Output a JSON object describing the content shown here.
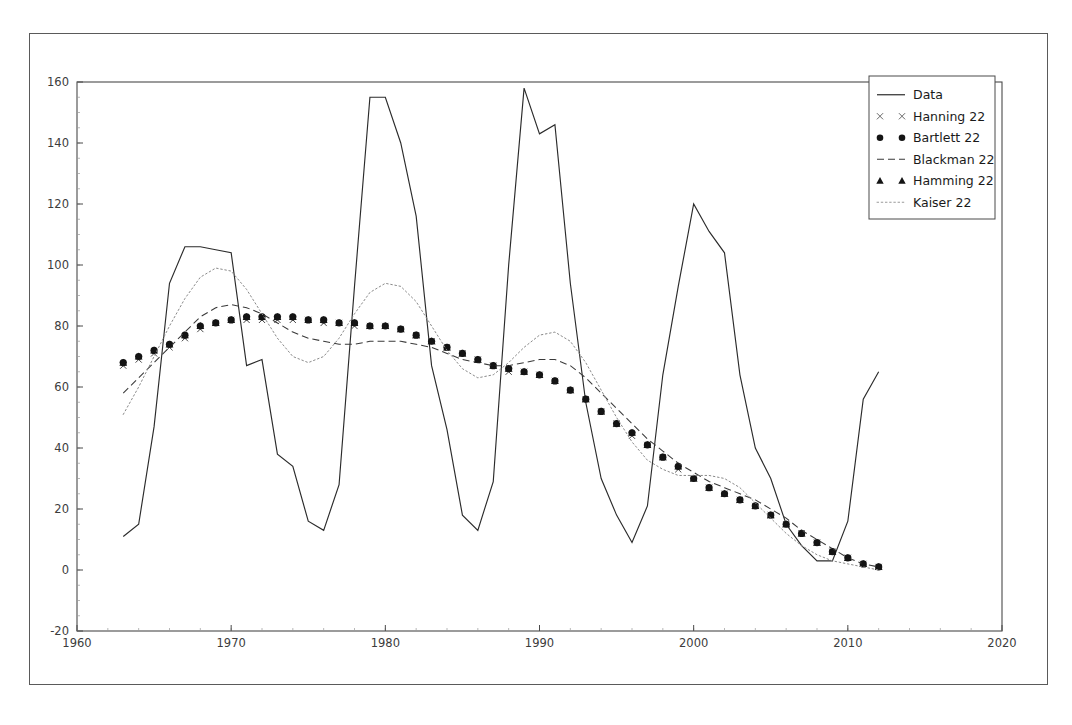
{
  "page": {
    "scan_header": "",
    "background_color": "#ffffff",
    "frame_color": "#5a5a5a"
  },
  "chart_data": {
    "type": "line",
    "title": "",
    "subtitle": "",
    "xlabel": "",
    "ylabel": "",
    "xlim": [
      1960,
      2020
    ],
    "ylim": [
      -20,
      160
    ],
    "xticks": [
      1960,
      1970,
      1980,
      1990,
      2000,
      2010,
      2020
    ],
    "xtick_labels": [
      "1960",
      "1970",
      "1980",
      "1990",
      "2000",
      "2010",
      "2020"
    ],
    "yticks": [
      -20,
      0,
      20,
      40,
      60,
      80,
      100,
      120,
      140,
      160
    ],
    "ytick_labels": [
      "-20",
      "0",
      "20",
      "40",
      "60",
      "80",
      "100",
      "120",
      "140",
      "160"
    ],
    "grid": false,
    "legend_position": "upper right",
    "legend_entries": [
      {
        "label": "Data",
        "style": "solid-line",
        "color": "#222222"
      },
      {
        "label": "Hanning 22",
        "style": "x-marker",
        "color": "#555555"
      },
      {
        "label": "Bartlett 22",
        "style": "circle-marker",
        "color": "#111111"
      },
      {
        "label": "Blackman 22",
        "style": "dashed-line",
        "color": "#333333"
      },
      {
        "label": "Hamming 22",
        "style": "triangle-marker",
        "color": "#111111"
      },
      {
        "label": "Kaiser 22",
        "style": "dotted-line",
        "color": "#777777"
      }
    ],
    "x": [
      1963,
      1964,
      1965,
      1966,
      1967,
      1968,
      1969,
      1970,
      1971,
      1972,
      1973,
      1974,
      1975,
      1976,
      1977,
      1978,
      1979,
      1980,
      1981,
      1982,
      1983,
      1984,
      1985,
      1986,
      1987,
      1988,
      1989,
      1990,
      1991,
      1992,
      1993,
      1994,
      1995,
      1996,
      1997,
      1998,
      1999,
      2000,
      2001,
      2002,
      2003,
      2004,
      2005,
      2006,
      2007,
      2008,
      2009,
      2010,
      2011,
      2012
    ],
    "series": [
      {
        "name": "Data",
        "style": "solid-line",
        "values": [
          11,
          15,
          47,
          94,
          106,
          106,
          105,
          104,
          67,
          69,
          38,
          34,
          16,
          13,
          28,
          93,
          155,
          155,
          140,
          116,
          67,
          46,
          18,
          13,
          29,
          100,
          158,
          143,
          146,
          94,
          55,
          30,
          18,
          9,
          21,
          64,
          93,
          120,
          111,
          104,
          64,
          40,
          30,
          15,
          8,
          3,
          3,
          16,
          56,
          65
        ]
      },
      {
        "name": "Hanning 22",
        "style": "x-marker",
        "values": [
          67,
          69,
          71,
          73,
          76,
          79,
          81,
          82,
          82,
          82,
          82,
          82,
          82,
          81,
          81,
          80,
          80,
          80,
          79,
          77,
          75,
          73,
          71,
          69,
          67,
          65,
          65,
          64,
          62,
          59,
          56,
          52,
          48,
          44,
          41,
          37,
          33,
          30,
          27,
          25,
          23,
          21,
          18,
          15,
          12,
          9,
          6,
          4,
          2,
          1
        ]
      },
      {
        "name": "Bartlett 22",
        "style": "circle-marker",
        "values": [
          68,
          70,
          72,
          74,
          77,
          80,
          81,
          82,
          83,
          83,
          83,
          83,
          82,
          82,
          81,
          81,
          80,
          80,
          79,
          77,
          75,
          73,
          71,
          69,
          67,
          66,
          65,
          64,
          62,
          59,
          56,
          52,
          48,
          45,
          41,
          37,
          34,
          30,
          27,
          25,
          23,
          21,
          18,
          15,
          12,
          9,
          6,
          4,
          2,
          1
        ]
      },
      {
        "name": "Blackman 22",
        "style": "dashed-line",
        "values": [
          58,
          63,
          68,
          73,
          78,
          83,
          86,
          87,
          86,
          84,
          81,
          78,
          76,
          75,
          74,
          74,
          75,
          75,
          75,
          74,
          73,
          71,
          69,
          68,
          67,
          67,
          68,
          69,
          69,
          67,
          63,
          58,
          53,
          48,
          43,
          39,
          35,
          32,
          29,
          27,
          25,
          23,
          20,
          17,
          13,
          10,
          7,
          4,
          2,
          1
        ]
      },
      {
        "name": "Hamming 22",
        "style": "triangle-marker",
        "values": [
          68,
          70,
          72,
          74,
          77,
          80,
          81,
          82,
          83,
          83,
          83,
          83,
          82,
          82,
          81,
          81,
          80,
          80,
          79,
          77,
          75,
          73,
          71,
          69,
          67,
          66,
          65,
          64,
          62,
          59,
          56,
          52,
          48,
          45,
          41,
          37,
          34,
          30,
          27,
          25,
          23,
          21,
          18,
          15,
          12,
          9,
          6,
          4,
          2,
          1
        ]
      },
      {
        "name": "Kaiser 22",
        "style": "dotted-line",
        "values": [
          51,
          60,
          70,
          80,
          89,
          96,
          99,
          98,
          92,
          84,
          76,
          70,
          68,
          70,
          76,
          84,
          91,
          94,
          93,
          88,
          80,
          72,
          66,
          63,
          64,
          68,
          73,
          77,
          78,
          75,
          68,
          59,
          50,
          42,
          36,
          33,
          31,
          31,
          31,
          30,
          27,
          22,
          17,
          12,
          8,
          5,
          3,
          2,
          1,
          0
        ]
      }
    ]
  }
}
